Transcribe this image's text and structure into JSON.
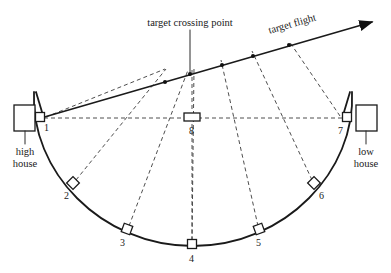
{
  "diagram": {
    "title_visible": false,
    "annotations": {
      "crossing_point": "target crossing point",
      "target_flight": "target flight",
      "high_house_line1": "high",
      "high_house_line2": "house",
      "low_house_line1": "low",
      "low_house_line2": "house"
    },
    "stations": [
      {
        "id": "1",
        "label": "1",
        "shape": "square-small",
        "x": 41,
        "y": 118,
        "label_x": 46,
        "label_y": 130
      },
      {
        "id": "2",
        "label": "2",
        "shape": "diamond",
        "x": 73,
        "y": 183,
        "label_x": 66,
        "label_y": 198
      },
      {
        "id": "3",
        "label": "3",
        "shape": "square",
        "x": 127,
        "y": 229,
        "label_x": 122,
        "label_y": 245
      },
      {
        "id": "4",
        "label": "4",
        "shape": "square",
        "x": 192,
        "y": 244,
        "label_x": 189,
        "label_y": 260
      },
      {
        "id": "5",
        "label": "5",
        "shape": "square",
        "x": 259,
        "y": 229,
        "label_x": 256,
        "label_y": 245
      },
      {
        "id": "6",
        "label": "6",
        "shape": "diamond",
        "x": 314,
        "y": 183,
        "label_x": 320,
        "label_y": 198
      },
      {
        "id": "7",
        "label": "7",
        "shape": "square-small",
        "x": 345,
        "y": 118,
        "label_x": 340,
        "label_y": 133
      },
      {
        "id": "8",
        "label": "8",
        "shape": "rect-wide",
        "x": 192,
        "y": 117,
        "label_x": 189,
        "label_y": 133
      }
    ],
    "houses": {
      "high": {
        "x": 14,
        "y": 105,
        "w": 21,
        "h": 26
      },
      "low": {
        "x": 356,
        "y": 105,
        "w": 21,
        "h": 26
      }
    },
    "colors": {
      "ink": "#1a1a1a",
      "dash": "#3a3a3a",
      "paper": "#ffffff"
    },
    "flight_path": {
      "start_x": 41,
      "start_y": 118,
      "end_x": 375,
      "end_y": 22,
      "marker_count": 5
    }
  }
}
